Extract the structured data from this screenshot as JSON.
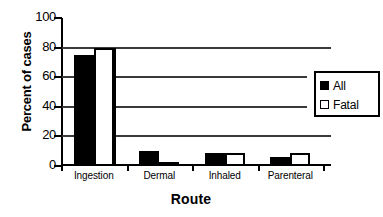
{
  "chart_data": {
    "type": "bar",
    "title": "",
    "xlabel": "Route",
    "ylabel": "Percent of cases",
    "categories": [
      "Ingestion",
      "Dermal",
      "Inhaled",
      "Parenteral"
    ],
    "series": [
      {
        "name": "All",
        "color": "#000000",
        "values": [
          75,
          10,
          9,
          6
        ]
      },
      {
        "name": "Fatal",
        "color": "#ffffff",
        "values": [
          80,
          3,
          9,
          8.5
        ]
      }
    ],
    "ylim": [
      0,
      100
    ],
    "yticks": [
      0,
      20,
      40,
      60,
      80,
      100
    ],
    "ytick_labels": [
      "0",
      "20",
      "40",
      "60",
      "80",
      "100"
    ],
    "gridlines": [
      20,
      40,
      60,
      80
    ],
    "grid": true,
    "legend_position": "right"
  },
  "legend": {
    "entries": [
      {
        "label": "All",
        "swatch": "filled-square"
      },
      {
        "label": "Fatal",
        "swatch": "open-square"
      }
    ]
  }
}
